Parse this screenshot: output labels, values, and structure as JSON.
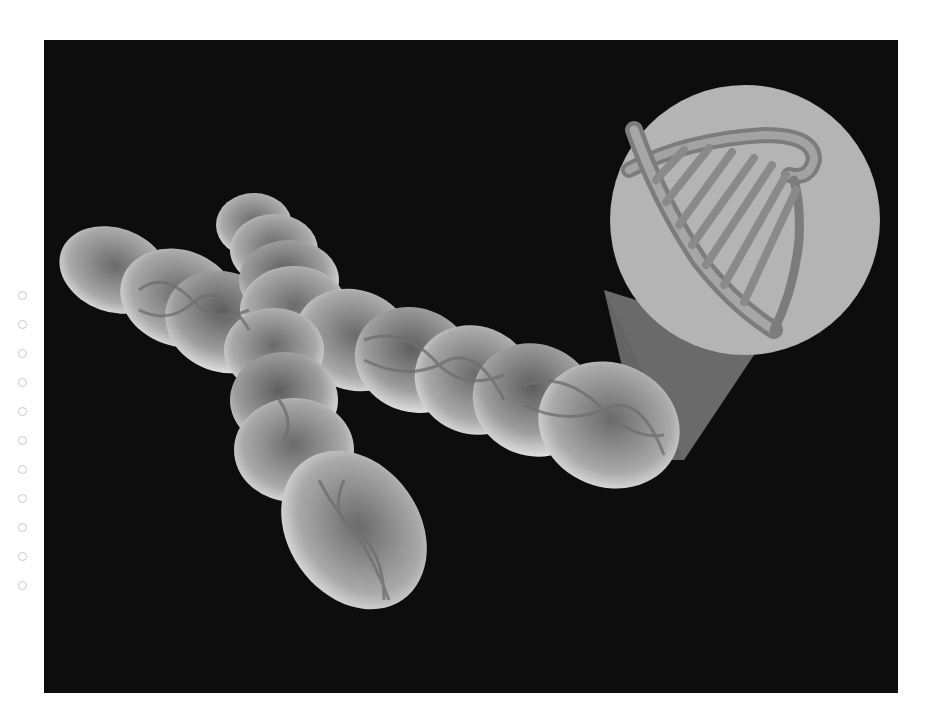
{
  "figure": {
    "background_color": "#0d0d0d",
    "chromosome_color": "#cfcfcf",
    "magnifier_color": "#b4b4b4",
    "beam_color": "#6e6e6e",
    "dna_color": "#8a8a8a"
  },
  "pagination": {
    "dot_count": 11,
    "dot_color": "#c9c9c9"
  }
}
